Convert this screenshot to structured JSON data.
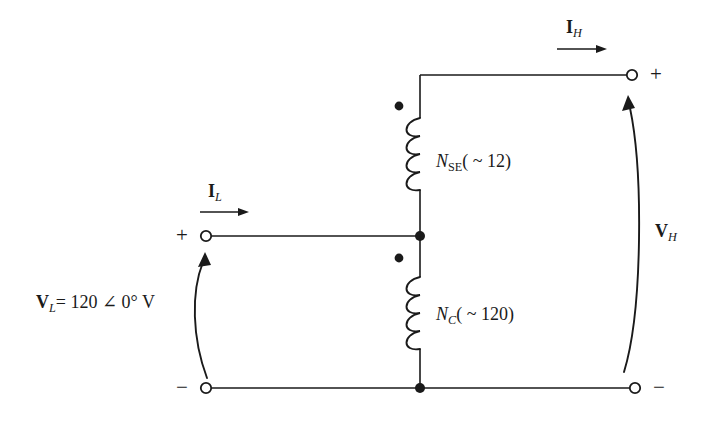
{
  "diagram": {
    "line_color": "#1a1a1a",
    "background": "#ffffff",
    "terminals": {
      "low_side_positive_sign": "+",
      "low_side_negative_sign": "−",
      "high_side_positive_sign": "+",
      "high_side_negative_sign": "−"
    },
    "labels": {
      "current_low_main": "I",
      "current_low_sub": "L",
      "current_high_main": "I",
      "current_high_sub": "H",
      "voltage_low_main": "V",
      "voltage_low_sub": "L",
      "voltage_low_value": "= 120 ∠ 0° V",
      "voltage_high_main": "V",
      "voltage_high_sub": "H",
      "winding_series_main": "N",
      "winding_series_sub": "SE",
      "winding_series_turns": "( ~ 12)",
      "winding_common_main": "N",
      "winding_common_sub": "C",
      "winding_common_turns": "( ~ 120)"
    }
  }
}
